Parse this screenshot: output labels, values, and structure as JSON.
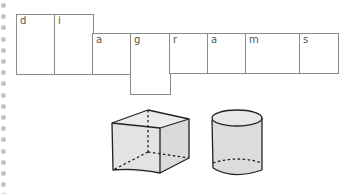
{
  "word": "diagrams",
  "letter_boxes": [
    {
      "letter": "d",
      "row": "upper"
    },
    {
      "letter": "i",
      "row": "upper"
    },
    {
      "letter": "a",
      "row": "middle"
    },
    {
      "letter": "g",
      "row": "descender"
    },
    {
      "letter": "r",
      "row": "middle"
    },
    {
      "letter": "a",
      "row": "middle"
    },
    {
      "letter": "m",
      "row": "middle"
    },
    {
      "letter": "s",
      "row": "middle"
    }
  ],
  "illustrations": [
    {
      "name": "cube",
      "hidden_edges": "dashed"
    },
    {
      "name": "cylinder",
      "hidden_edges": "dashed"
    }
  ],
  "colors": {
    "box_border": "#8a8a8a",
    "dot": "#c4c4c4",
    "shape_fill": "#e6e6e6",
    "shape_stroke": "#222222"
  }
}
